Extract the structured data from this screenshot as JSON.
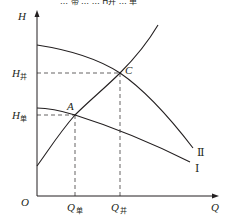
{
  "diagram": {
    "top_strip_text": "… 帯 …   …   H并 … 单",
    "axes": {
      "y_label": "H",
      "x_label": "Q",
      "origin_label": "O"
    },
    "curves": [
      {
        "name": "curve-II",
        "label": "Ⅱ",
        "description": "parallel pump curve (falling)"
      },
      {
        "name": "curve-I",
        "label": "Ⅰ",
        "description": "single pump curve (falling)"
      },
      {
        "name": "system-curve",
        "label": "",
        "description": "pipeline characteristic (rising)"
      }
    ],
    "points": {
      "A": "A",
      "C": "C"
    },
    "y_ticks": {
      "h_parallel_main": "H",
      "h_parallel_sub": "并",
      "h_single_main": "H",
      "h_single_sub": "单"
    },
    "x_ticks": {
      "q_single_main": "Q",
      "q_single_sub": "单",
      "q_parallel_main": "Q",
      "q_parallel_sub": "并"
    },
    "colors": {
      "line": "#231f20",
      "background": "#ffffff"
    }
  }
}
